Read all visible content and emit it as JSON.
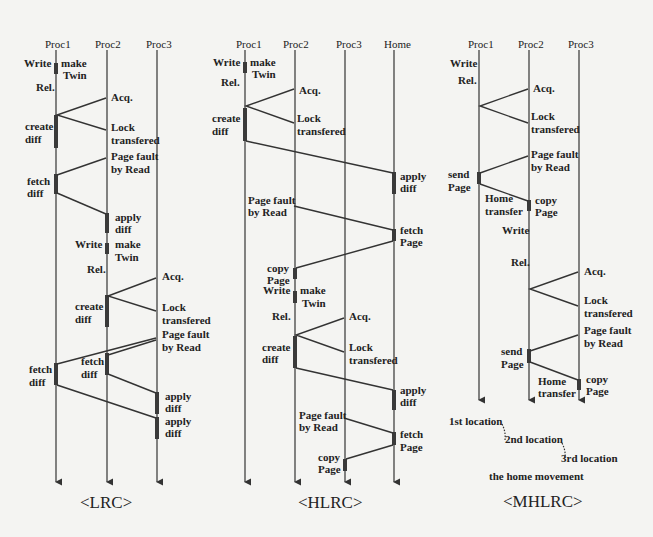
{
  "lrc": {
    "caption": "<LRC>",
    "processes": [
      "Proc1",
      "Proc2",
      "Proc3"
    ],
    "labels": {
      "write1": "Write",
      "make_twin1a": "make",
      "make_twin1b": "Twin",
      "rel1": "Rel.",
      "acq1": "Acq.",
      "create_diff1a": "create",
      "create_diff1b": "diff",
      "lock1a": "Lock",
      "lock1b": "transfered",
      "pf1a": "Page fault",
      "pf1b": "by Read",
      "fetch1a": "fetch",
      "fetch1b": "diff",
      "apply1a": "apply",
      "apply1b": "diff",
      "write2": "Write",
      "make_twin2a": "make",
      "make_twin2b": "Twin",
      "rel2": "Rel.",
      "acq2": "Acq.",
      "create_diff2a": "create",
      "create_diff2b": "diff",
      "lock2a": "Lock",
      "lock2b": "transfered",
      "pf2a": "Page fault",
      "pf2b": "by Read",
      "fetch2a": "fetch",
      "fetch2b": "diff",
      "fetch3a": "fetch",
      "fetch3b": "diff",
      "apply2a": "apply",
      "apply2b": "diff",
      "apply3a": "apply",
      "apply3b": "diff"
    }
  },
  "hlrc": {
    "caption": "<HLRC>",
    "processes": [
      "Proc1",
      "Proc2",
      "Proc3",
      "Home"
    ],
    "labels": {
      "write1": "Write",
      "make_twin1a": "make",
      "make_twin1b": "Twin",
      "rel1": "Rel.",
      "acq1": "Acq.",
      "create_diff1a": "create",
      "create_diff1b": "diff",
      "lock1a": "Lock",
      "lock1b": "transfered",
      "apply1a": "apply",
      "apply1b": "diff",
      "pf1a": "Page fault",
      "pf1b": "by Read",
      "fetch1a": "fetch",
      "fetch1b": "Page",
      "copy1a": "copy",
      "copy1b": "Page",
      "write2": "Write",
      "make_twin2a": "make",
      "make_twin2b": "Twin",
      "rel2": "Rel.",
      "acq2": "Acq.",
      "create_diff2a": "create",
      "create_diff2b": "diff",
      "lock2a": "Lock",
      "lock2b": "transfered",
      "apply2a": "apply",
      "apply2b": "diff",
      "pf2a": "Page fault",
      "pf2b": "by Read",
      "fetch2a": "fetch",
      "fetch2b": "Page",
      "copy2a": "copy",
      "copy2b": "Page"
    }
  },
  "mhlrc": {
    "caption": "<MHLRC>",
    "processes": [
      "Proc1",
      "Proc2",
      "Proc3"
    ],
    "labels": {
      "write1": "Write",
      "rel1": "Rel.",
      "acq1": "Acq.",
      "lock1a": "Lock",
      "lock1b": "transfered",
      "pf1a": "Page fault",
      "pf1b": "by Read",
      "send1a": "send",
      "send1b": "Page",
      "home1a": "Home",
      "home1b": "transfer",
      "copy1a": "copy",
      "copy1b": "Page",
      "write2": "Write",
      "rel2": "Rel.",
      "acq2": "Acq.",
      "lock2a": "Lock",
      "lock2b": "transfered",
      "pf2a": "Page fault",
      "pf2b": "by Read",
      "send2a": "send",
      "send2b": "Page",
      "home2a": "Home",
      "home2b": "transfer",
      "copy2a": "copy",
      "copy2b": "Page"
    },
    "legend": {
      "loc1": "1st location",
      "loc2": "2nd location",
      "loc3": "3rd location",
      "title": "the home movement"
    }
  }
}
